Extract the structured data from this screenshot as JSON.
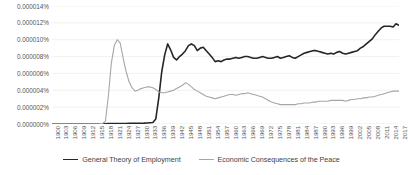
{
  "chart_data": {
    "type": "line",
    "title": "",
    "subtitle": "",
    "xlabel": "",
    "ylabel": "",
    "grid": true,
    "legend_position": "bottom",
    "xlim": [
      1900,
      2017
    ],
    "ylim": [
      0,
      1.4e-05
    ],
    "y_tick_labels": [
      "0.000014%",
      "0.000012%",
      "0.000010%",
      "0.000008%",
      "0.000006%",
      "0.000004%",
      "0.000002%",
      "0.000000%"
    ],
    "y_tick_values": [
      1.4e-05,
      1.2e-05,
      1e-05,
      8e-06,
      6e-06,
      4e-06,
      2e-06,
      0
    ],
    "x_tick_labels": [
      "1900",
      "1903",
      "1906",
      "1909",
      "1912",
      "1915",
      "1918",
      "1921",
      "1924",
      "1927",
      "1930",
      "1933",
      "1936",
      "1939",
      "1942",
      "1945",
      "1948",
      "1951",
      "1954",
      "1957",
      "1960",
      "1963",
      "1966",
      "1969",
      "1972",
      "1975",
      "1978",
      "1981",
      "1984",
      "1987",
      "1990",
      "1993",
      "1996",
      "1999",
      "2002",
      "2005",
      "2008",
      "2011",
      "2014",
      "2017"
    ],
    "x": [
      1900,
      1901,
      1902,
      1903,
      1904,
      1905,
      1906,
      1907,
      1908,
      1909,
      1910,
      1911,
      1912,
      1913,
      1914,
      1915,
      1916,
      1917,
      1918,
      1919,
      1920,
      1921,
      1922,
      1923,
      1924,
      1925,
      1926,
      1927,
      1928,
      1929,
      1930,
      1931,
      1932,
      1933,
      1934,
      1935,
      1936,
      1937,
      1938,
      1939,
      1940,
      1941,
      1942,
      1943,
      1944,
      1945,
      1946,
      1947,
      1948,
      1949,
      1950,
      1951,
      1952,
      1953,
      1954,
      1955,
      1956,
      1957,
      1958,
      1959,
      1960,
      1961,
      1962,
      1963,
      1964,
      1965,
      1966,
      1967,
      1968,
      1969,
      1970,
      1971,
      1972,
      1973,
      1974,
      1975,
      1976,
      1977,
      1978,
      1979,
      1980,
      1981,
      1982,
      1983,
      1984,
      1985,
      1986,
      1987,
      1988,
      1989,
      1990,
      1991,
      1992,
      1993,
      1994,
      1995,
      1996,
      1997,
      1998,
      1999,
      2000,
      2001,
      2002,
      2003,
      2004,
      2005,
      2006,
      2007,
      2008,
      2009,
      2010,
      2011,
      2012,
      2013,
      2014,
      2015,
      2016,
      2017
    ],
    "series": [
      {
        "name": "General Theory of Employment",
        "color": "#262626",
        "width": 1.6,
        "values": [
          2e-08,
          2e-08,
          2e-08,
          2e-08,
          2e-08,
          2e-08,
          2e-08,
          2e-08,
          2e-08,
          2e-08,
          2e-08,
          2e-08,
          2e-08,
          2e-08,
          2e-08,
          2e-08,
          2e-08,
          2e-08,
          3e-08,
          4e-08,
          5e-08,
          6e-08,
          6e-08,
          6e-08,
          6e-08,
          6e-08,
          7e-08,
          7e-08,
          8e-08,
          8e-08,
          9e-08,
          1e-07,
          1.2e-07,
          1.5e-07,
          1.8e-07,
          6e-07,
          3.1e-06,
          6.2e-06,
          8.2e-06,
          9.5e-06,
          8.8e-06,
          7.9e-06,
          7.6e-06,
          8e-06,
          8.3e-06,
          8.7e-06,
          9.3e-06,
          9.5e-06,
          9.3e-06,
          8.7e-06,
          9e-06,
          9.1e-06,
          8.7e-06,
          8.3e-06,
          7.9e-06,
          7.4e-06,
          7.5e-06,
          7.4e-06,
          7.6e-06,
          7.7e-06,
          7.7e-06,
          7.8e-06,
          7.9e-06,
          7.8e-06,
          7.9e-06,
          8e-06,
          8e-06,
          7.9e-06,
          7.8e-06,
          7.8e-06,
          7.9e-06,
          8e-06,
          7.9e-06,
          7.8e-06,
          7.8e-06,
          7.9e-06,
          8e-06,
          7.8e-06,
          7.9e-06,
          8e-06,
          8.1e-06,
          7.9e-06,
          7.8e-06,
          8e-06,
          8.2e-06,
          8.4e-06,
          8.5e-06,
          8.6e-06,
          8.7e-06,
          8.7e-06,
          8.6e-06,
          8.5e-06,
          8.4e-06,
          8.3e-06,
          8.4e-06,
          8.3e-06,
          8.5e-06,
          8.6e-06,
          8.4e-06,
          8.3e-06,
          8.4e-06,
          8.5e-06,
          8.6e-06,
          8.7e-06,
          9e-06,
          9.2e-06,
          9.5e-06,
          9.8e-06,
          1.01e-05,
          1.06e-05,
          1.1e-05,
          1.14e-05,
          1.16e-05,
          1.16e-05,
          1.16e-05,
          1.15e-05,
          1.19e-05,
          1.17e-05
        ]
      },
      {
        "name": "Economic Consequences of the Peace",
        "color": "#a6a6a6",
        "width": 1.1,
        "values": [
          2e-08,
          2e-08,
          2e-08,
          2e-08,
          2e-08,
          2e-08,
          2e-08,
          2e-08,
          2e-08,
          2e-08,
          2e-08,
          2e-08,
          2e-08,
          2e-08,
          2e-08,
          3e-08,
          4e-08,
          6e-08,
          3e-07,
          3.3e-06,
          7.2e-06,
          9.3e-06,
          1e-05,
          9.6e-06,
          7.8e-06,
          6.2e-06,
          5e-06,
          4.3e-06,
          3.9e-06,
          4e-06,
          4.2e-06,
          4.3e-06,
          4.4e-06,
          4.4e-06,
          4.3e-06,
          4.1e-06,
          3.8e-06,
          3.7e-06,
          3.7e-06,
          3.8e-06,
          3.9e-06,
          4e-06,
          4.2e-06,
          4.4e-06,
          4.6e-06,
          4.9e-06,
          4.7e-06,
          4.4e-06,
          4.1e-06,
          3.9e-06,
          3.7e-06,
          3.5e-06,
          3.3e-06,
          3.2e-06,
          3.1e-06,
          3e-06,
          3.1e-06,
          3.2e-06,
          3.3e-06,
          3.4e-06,
          3.5e-06,
          3.5e-06,
          3.4e-06,
          3.5e-06,
          3.6e-06,
          3.6e-06,
          3.7e-06,
          3.6e-06,
          3.5e-06,
          3.4e-06,
          3.3e-06,
          3.2e-06,
          3e-06,
          2.8e-06,
          2.6e-06,
          2.5e-06,
          2.4e-06,
          2.3e-06,
          2.3e-06,
          2.3e-06,
          2.3e-06,
          2.3e-06,
          2.3e-06,
          2.4e-06,
          2.4e-06,
          2.5e-06,
          2.5e-06,
          2.5e-06,
          2.6e-06,
          2.6e-06,
          2.7e-06,
          2.7e-06,
          2.7e-06,
          2.7e-06,
          2.8e-06,
          2.8e-06,
          2.8e-06,
          2.8e-06,
          2.8e-06,
          2.7e-06,
          2.8e-06,
          2.9e-06,
          2.9e-06,
          3e-06,
          3e-06,
          3.1e-06,
          3.1e-06,
          3.2e-06,
          3.2e-06,
          3.3e-06,
          3.4e-06,
          3.5e-06,
          3.6e-06,
          3.7e-06,
          3.8e-06,
          3.9e-06,
          3.9e-06,
          3.9e-06
        ]
      }
    ]
  },
  "colors": {
    "series_dark": "#262626",
    "series_light": "#a6a6a6",
    "gridline": "#e8e8e8",
    "axis_text": "#555555",
    "background": "#ffffff"
  }
}
